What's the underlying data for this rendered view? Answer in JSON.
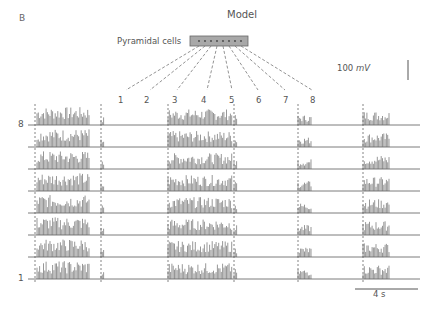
{
  "figure": {
    "panel_letter": "B",
    "title": "Model",
    "population_label": "Pyramidal cells",
    "cell_count": 8,
    "stimulus_numbers": [
      "1",
      "2",
      "3",
      "4",
      "5",
      "6",
      "7",
      "8"
    ],
    "row_labels": {
      "top": "8",
      "bottom": "1"
    },
    "scale_bar_voltage": {
      "value": "100",
      "unit": "mV"
    },
    "scale_bar_time": "4 s",
    "colors": {
      "trace": "#5a5a5a",
      "box_fill": "#a8a8a8",
      "box_stroke": "#666666",
      "dashed": "#666666",
      "text": "#555555"
    }
  },
  "chart_data": {
    "type": "line",
    "title": "Model",
    "rows": [
      "8",
      "7",
      "6",
      "5",
      "4",
      "3",
      "2",
      "1"
    ],
    "stimulus_markers_x_px": [
      35,
      101,
      168,
      234,
      298,
      363
    ],
    "activity_epochs": [
      {
        "start_marker": 1,
        "label": "epoch A",
        "rows_active": "all",
        "duration_s_approx": 3.0
      },
      {
        "start_marker": 2,
        "label": "brief transient",
        "rows_active": "all",
        "duration_s_approx": 0.1
      },
      {
        "start_marker": 3,
        "label": "epoch B",
        "rows_active": "all",
        "duration_s_approx": 3.0
      },
      {
        "start_marker": 4,
        "label": "brief transient",
        "rows_active": "all",
        "duration_s_approx": 0.1
      },
      {
        "start_marker": 5,
        "label": "epoch C (short bursts)",
        "rows_active": "all",
        "duration_s_approx": 1.0
      },
      {
        "start_marker": 6,
        "label": "epoch D",
        "rows_active": "all",
        "duration_s_approx": 2.0
      }
    ],
    "scale": {
      "voltage": "100 mV",
      "time": "4 s"
    }
  }
}
